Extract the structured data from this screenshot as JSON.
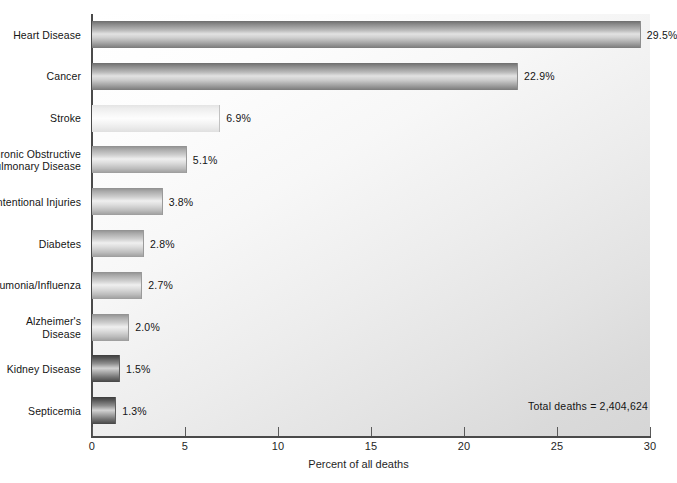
{
  "chart_data": {
    "type": "bar",
    "orientation": "horizontal",
    "title": "",
    "xlabel": "Percent of all deaths",
    "ylabel": "",
    "xlim": [
      0,
      30
    ],
    "xticks": [
      0,
      5,
      10,
      15,
      20,
      25,
      30
    ],
    "xtick_labels": [
      "0",
      "5",
      "10",
      "15",
      "20",
      "25",
      "30"
    ],
    "grid": false,
    "legend": null,
    "categories": [
      "Heart Disease",
      "Cancer",
      "Stroke",
      "Chronic Obstructive Pulmonary Disease",
      "Unintentional Injuries",
      "Diabetes",
      "Pneumonia/Influenza",
      "Alzheimer's Disease",
      "Kidney Disease",
      "Septicemia"
    ],
    "values": [
      29.5,
      22.9,
      6.9,
      5.1,
      3.8,
      2.8,
      2.7,
      2.0,
      1.5,
      1.3
    ],
    "value_labels": [
      "29.5%",
      "22.9%",
      "6.9%",
      "5.1%",
      "3.8%",
      "2.8%",
      "2.7%",
      "2.0%",
      "1.5%",
      "1.3%"
    ],
    "annotations": [
      "Total deaths = 2,404,624"
    ]
  },
  "bars": [
    {
      "label_line1": "Heart Disease",
      "label_line2": "",
      "value": 29.5,
      "value_label": "29.5%",
      "tone": "tone-dark"
    },
    {
      "label_line1": "Cancer",
      "label_line2": "",
      "value": 22.9,
      "value_label": "22.9%",
      "tone": "tone-dark"
    },
    {
      "label_line1": "Stroke",
      "label_line2": "",
      "value": 6.9,
      "value_label": "6.9%",
      "tone": "tone-light"
    },
    {
      "label_line1": "Chronic Obstructive",
      "label_line2": "Pulmonary Disease",
      "value": 5.1,
      "value_label": "5.1%",
      "tone": "tone-mid"
    },
    {
      "label_line1": "Unintentional Injuries",
      "label_line2": "",
      "value": 3.8,
      "value_label": "3.8%",
      "tone": "tone-mid"
    },
    {
      "label_line1": "Diabetes",
      "label_line2": "",
      "value": 2.8,
      "value_label": "2.8%",
      "tone": "tone-mid"
    },
    {
      "label_line1": "Pneumonia/Influenza",
      "label_line2": "",
      "value": 2.7,
      "value_label": "2.7%",
      "tone": "tone-mid"
    },
    {
      "label_line1": "Alzheimer's",
      "label_line2": "Disease",
      "value": 2.0,
      "value_label": "2.0%",
      "tone": "tone-mid"
    },
    {
      "label_line1": "Kidney Disease",
      "label_line2": "",
      "value": 1.5,
      "value_label": "1.5%",
      "tone": "tone-verydark"
    },
    {
      "label_line1": "Septicemia",
      "label_line2": "",
      "value": 1.3,
      "value_label": "1.3%",
      "tone": "tone-verydark"
    }
  ],
  "axis": {
    "x_title": "Percent of all deaths",
    "ticks": [
      "0",
      "5",
      "10",
      "15",
      "20",
      "25",
      "30"
    ]
  },
  "annotation": {
    "total_deaths": "Total deaths = 2,404,624"
  }
}
